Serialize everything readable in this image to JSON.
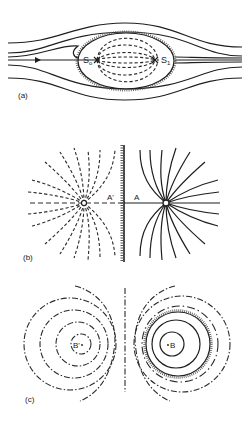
{
  "figure": {
    "panels": [
      {
        "id": "a",
        "label": "(a)",
        "description": "Streamlines of uniform flow past a closed body (Rankine oval) with internal dashed streamlines between source S0 and sink S1",
        "points": [
          {
            "name": "source",
            "label": "S",
            "subscript": "o"
          },
          {
            "name": "sink",
            "label": "S",
            "subscript": "1"
          }
        ]
      },
      {
        "id": "b",
        "label": "(b)",
        "description": "Source near a plane wall with its mirror image; solid field lines on the real side, dashed image lines on the mirrored side",
        "points": [
          {
            "name": "image-point",
            "label": "A'"
          },
          {
            "name": "real-point",
            "label": "A"
          }
        ]
      },
      {
        "id": "c",
        "label": "(c)",
        "description": "Vortex near a hatched circular boundary with its image; dash-dot circles around image B' and around B, solid circles inside the boundary",
        "points": [
          {
            "name": "image-point",
            "label": "B'"
          },
          {
            "name": "real-point",
            "label": "B"
          }
        ]
      }
    ]
  },
  "labels": {
    "a": "(a)",
    "b": "(b)",
    "c": "(c)",
    "S0": "S",
    "S0_sub": "o",
    "S1": "S",
    "S1_sub": "1",
    "A_prime": "A'",
    "A": "A",
    "B_prime": "B'",
    "B": "B"
  },
  "colors": {
    "ink": "#1e1e1e",
    "background": "#ffffff"
  }
}
